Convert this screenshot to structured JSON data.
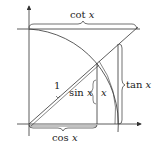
{
  "diagram": {
    "labels": {
      "cot": {
        "fn": "cot",
        "var": "x"
      },
      "tan": {
        "fn": "tan",
        "var": "x"
      },
      "sin": {
        "fn": "sin",
        "var": "x"
      },
      "cos": {
        "fn": "cos",
        "var": "x"
      },
      "radius": "1",
      "arc": "x"
    },
    "colors": {
      "stroke": "#333333",
      "background": "#ffffff"
    }
  }
}
